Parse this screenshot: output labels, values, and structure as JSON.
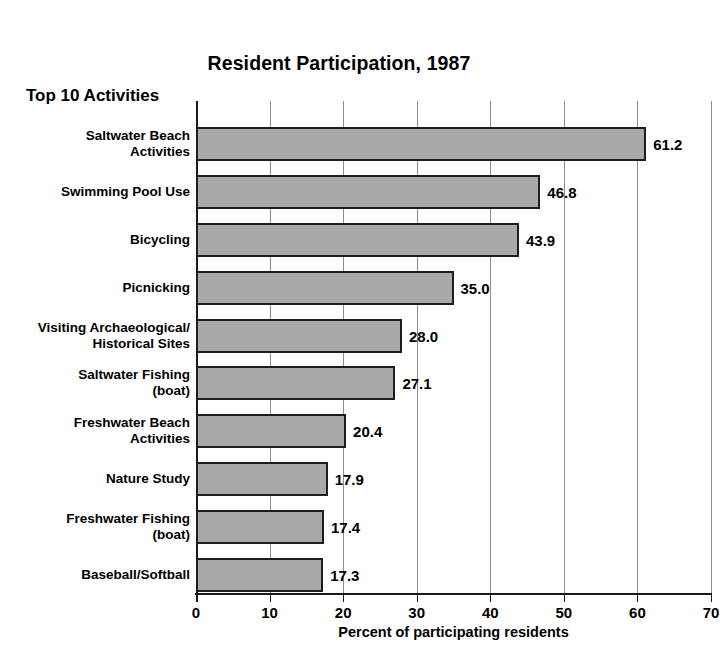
{
  "chart_data": {
    "type": "bar",
    "orientation": "horizontal",
    "title": "Resident Participation, 1987",
    "corner_label": "Top 10 Activities",
    "xlabel": "Percent of participating residents",
    "ylabel": "",
    "xlim": [
      0,
      70
    ],
    "xticks": [
      0,
      10,
      20,
      30,
      40,
      50,
      60,
      70
    ],
    "xtick_labels": [
      "0",
      "10",
      "20",
      "30",
      "40",
      "50",
      "60",
      "70"
    ],
    "grid": "vertical",
    "legend": "none",
    "categories": [
      "Saltwater Beach\nActivities",
      "Swimming Pool Use",
      "Bicycling",
      "Picnicking",
      "Visiting Archaeological/\nHistorical Sites",
      "Saltwater Fishing\n(boat)",
      "Freshwater Beach\nActivities",
      "Nature Study",
      "Freshwater Fishing\n(boat)",
      "Baseball/Softball"
    ],
    "values": [
      61.2,
      46.8,
      43.9,
      35.0,
      28.0,
      27.1,
      20.4,
      17.9,
      17.4,
      17.3
    ],
    "value_labels": [
      "61.2",
      "46.8",
      "43.9",
      "35.0",
      "28.0",
      "27.1",
      "20.4",
      "17.9",
      "17.4",
      "17.3"
    ],
    "bar_color": "#a9a9a9",
    "bar_edge_color": "#1d1d1d",
    "axis_color": "#1a1a1a",
    "grid_color": "#8d8d8d",
    "background_color": "#ffffff"
  }
}
